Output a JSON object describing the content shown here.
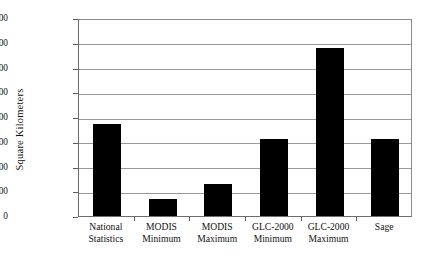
{
  "chart_data": {
    "type": "bar",
    "title": "",
    "xlabel": "",
    "ylabel": "Square Kilometers",
    "categories": [
      "National Statistics",
      "MODIS Minimum",
      "MODIS Maximum",
      "GLC-2000 Minimum",
      "GLC-2000 Maximum",
      "Sage"
    ],
    "category_lines": [
      [
        "National",
        "Statistics"
      ],
      [
        "MODIS",
        "Minimum"
      ],
      [
        "MODIS",
        "Maximum"
      ],
      [
        "GLC-2000",
        "Minimum"
      ],
      [
        "GLC-2000",
        "Maximum"
      ],
      [
        "Sage",
        ""
      ]
    ],
    "values": [
      3700000,
      700000,
      1300000,
      3100000,
      6800000,
      3100000
    ],
    "ylim": [
      0,
      8000000
    ],
    "ytick_labels": [
      "8000000",
      "7000000",
      "6000000",
      "5000000",
      "4000000",
      "3000000",
      "2000000",
      "1000000",
      "0"
    ],
    "ytick_values": [
      8000000,
      7000000,
      6000000,
      5000000,
      4000000,
      3000000,
      2000000,
      1000000,
      0
    ],
    "grid": true,
    "legend": false,
    "bar_color": "#000000",
    "grid_color": "#9a9a9a",
    "axis_color": "#6e6e6e"
  }
}
